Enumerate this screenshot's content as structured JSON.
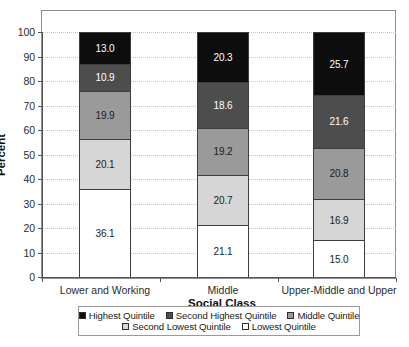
{
  "chart_data": {
    "type": "bar",
    "subtype": "stacked-bar-100",
    "title": "",
    "xlabel": "Social Class",
    "ylabel": "Percent",
    "ylim": [
      0,
      100
    ],
    "yticks": [
      0,
      10,
      20,
      30,
      40,
      50,
      60,
      70,
      80,
      90,
      100
    ],
    "grid": true,
    "legend_position": "bottom",
    "categories": [
      "Lower and Working",
      "Middle",
      "Upper-Middle and Upper"
    ],
    "series": [
      {
        "name": "Lowest Quintile",
        "values": [
          36.1,
          21.1,
          15.0
        ],
        "color": "#ffffff"
      },
      {
        "name": "Second Lowest Quintile",
        "values": [
          20.1,
          20.7,
          16.9
        ],
        "color": "#d6d6d6"
      },
      {
        "name": "Middle Quintile",
        "values": [
          19.9,
          19.2,
          20.8
        ],
        "color": "#9a9a9a"
      },
      {
        "name": "Second Highest Quintile",
        "values": [
          10.9,
          18.6,
          21.6
        ],
        "color": "#4d4d4d"
      },
      {
        "name": "Highest Quintile",
        "values": [
          13.0,
          20.3,
          25.7
        ],
        "color": "#0d0d0d"
      }
    ],
    "legend": [
      {
        "label": "Highest Quintile",
        "color": "#0d0d0d"
      },
      {
        "label": "Second Highest Quintile",
        "color": "#4d4d4d"
      },
      {
        "label": "Middle Quintile",
        "color": "#9a9a9a"
      },
      {
        "label": "Second Lowest Quintile",
        "color": "#d6d6d6"
      },
      {
        "label": "Lowest Quintile",
        "color": "#ffffff"
      }
    ],
    "data_labels": {
      "Lower and Working": [
        "36.1",
        "20.1",
        "19.9",
        "10.9",
        "13.0"
      ],
      "Middle": [
        "21.1",
        "20.7",
        "19.2",
        "18.6",
        "20.3"
      ],
      "Upper-Middle and Upper": [
        "15.0",
        "16.9",
        "20.8",
        "21.6",
        "25.7"
      ]
    }
  }
}
